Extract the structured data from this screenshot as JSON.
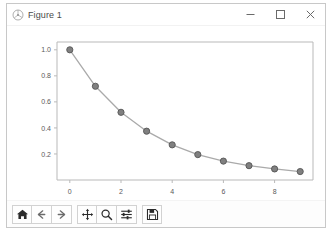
{
  "window": {
    "title": "Figure 1",
    "icon": "matplotlib-icon",
    "controls": [
      {
        "name": "minimize-button",
        "glyph": "minimize-icon",
        "label": "Minimize"
      },
      {
        "name": "maximize-button",
        "glyph": "maximize-icon",
        "label": "Maximize"
      },
      {
        "name": "close-button",
        "glyph": "close-icon",
        "label": "Close"
      }
    ],
    "background": "#ffffff",
    "border_color": "#c8c8c8"
  },
  "toolbar": {
    "buttons": [
      {
        "name": "home-button",
        "icon": "home-icon",
        "tooltip": "Reset original view"
      },
      {
        "name": "back-button",
        "icon": "arrow-left-icon",
        "tooltip": "Back to previous view"
      },
      {
        "name": "forward-button",
        "icon": "arrow-right-icon",
        "tooltip": "Forward to next view"
      },
      {
        "name": "pan-button",
        "icon": "pan-move-icon",
        "tooltip": "Pan axes with left mouse, zoom with right"
      },
      {
        "name": "zoom-button",
        "icon": "magnifier-icon",
        "tooltip": "Zoom to rectangle"
      },
      {
        "name": "configure-subplots-button",
        "icon": "sliders-icon",
        "tooltip": "Configure subplots"
      },
      {
        "name": "save-button",
        "icon": "floppy-disk-icon",
        "tooltip": "Save the figure"
      }
    ]
  },
  "chart_data": {
    "type": "line",
    "title": "",
    "xlabel": "",
    "ylabel": "",
    "x": [
      0,
      1,
      2,
      3,
      4,
      5,
      6,
      7,
      8,
      9
    ],
    "series": [
      {
        "name": "decay",
        "values": [
          1.0,
          0.72,
          0.52,
          0.375,
          0.27,
          0.195,
          0.145,
          0.11,
          0.085,
          0.065
        ],
        "line_color": "#aaaaaa",
        "marker": "circle",
        "marker_face_color": "#808080",
        "marker_edge_color": "#555555"
      }
    ],
    "xlim": [
      -0.5,
      9.5
    ],
    "ylim": [
      0.0,
      1.06
    ],
    "xticks": [
      0,
      2,
      4,
      6,
      8
    ],
    "xticklabels": [
      "0",
      "2",
      "4",
      "6",
      "8"
    ],
    "yticks": [
      0.2,
      0.4,
      0.6,
      0.8,
      1.0
    ],
    "yticklabels": [
      "0.2",
      "0.4",
      "0.6",
      "0.8",
      "1.0"
    ],
    "grid": false,
    "legend": null,
    "spines": {
      "top": true,
      "right": true,
      "bottom": true,
      "left": true
    },
    "spine_color": "#b9b9b9",
    "tick_label_color": "#5a5a5a",
    "tick_label_size": 7,
    "facecolor": "#ffffff"
  }
}
